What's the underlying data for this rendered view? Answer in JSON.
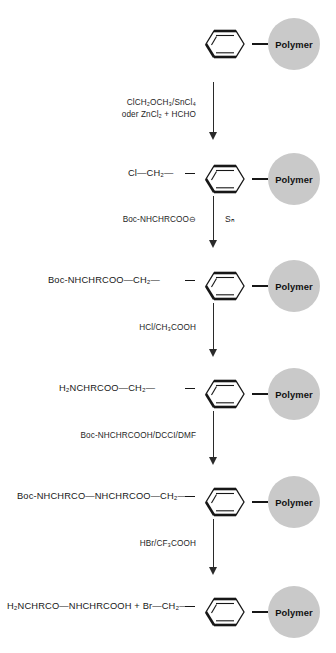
{
  "diagram": {
    "polymer_bead_label": "Polymer",
    "bead_color": "#c9c9c9",
    "line_color": "#171717",
    "steps": [
      {
        "id": "step-1-polystyrene",
        "left_text": "",
        "ring": true,
        "bead": true
      },
      {
        "id": "step-2-chloromethylated",
        "left_text": "Cl—CH₂—",
        "ring": true,
        "bead": true
      },
      {
        "id": "step-3-boc-amino-acid-ester",
        "left_text": "Boc-NHCHRCOO—CH₂—",
        "ring": true,
        "bead": true
      },
      {
        "id": "step-4-free-amine",
        "left_text": "H₂NCHRCOO—CH₂—",
        "ring": true,
        "bead": true
      },
      {
        "id": "step-5-dipeptide-resin",
        "left_text": "Boc-NHCHRCO—NHCHRCOO—CH₂—",
        "ring": true,
        "bead": true
      },
      {
        "id": "step-6-cleaved-product",
        "left_text": "H₂NCHRCO—NHCHRCOOH + Br—CH₂—",
        "ring": true,
        "bead": true
      }
    ],
    "reactions": [
      {
        "id": "reaction-1-chloromethylation",
        "lines": [
          "ClCH₂OCH₃/SnCl₄",
          "oder ZnCl₂ + HCHO"
        ],
        "mechanism": ""
      },
      {
        "id": "reaction-2-esterification",
        "lines": [
          "Boc-NHCHRCOO⊖"
        ],
        "mechanism": "Sₙ"
      },
      {
        "id": "reaction-3-boc-deprotection",
        "lines": [
          "HCl/CH₃COOH"
        ],
        "mechanism": ""
      },
      {
        "id": "reaction-4-coupling",
        "lines": [
          "Boc-NHCHRCOOH/DCCI/DMF"
        ],
        "mechanism": ""
      },
      {
        "id": "reaction-5-cleavage",
        "lines": [
          "HBr/CF₃COOH"
        ],
        "mechanism": ""
      }
    ]
  }
}
